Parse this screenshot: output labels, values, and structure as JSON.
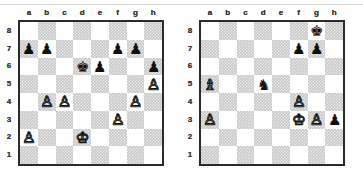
{
  "page": {
    "background_color": "#ffffff",
    "hairline_color": "#d8d8d8"
  },
  "colors": {
    "light_square": "#ffffff",
    "dark_square": "#c9c9c9",
    "border": "#2b2b2b",
    "coordinate_text": "#3a3a3a",
    "black_piece": "#101010",
    "white_piece_fill": "#ffffff",
    "white_piece_outline": "#101010"
  },
  "glyphs": {
    "white_king": "♔",
    "white_queen": "♕",
    "white_rook": "♖",
    "white_bishop": "♗",
    "white_knight": "♘",
    "white_pawn": "♙",
    "black_king": "♚",
    "black_queen": "♛",
    "black_rook": "♜",
    "black_bishop": "♝",
    "black_knight": "♞",
    "black_pawn": "♟"
  },
  "coordinates": {
    "files": [
      "a",
      "b",
      "c",
      "d",
      "e",
      "f",
      "g",
      "h"
    ],
    "ranks": [
      "8",
      "7",
      "6",
      "5",
      "4",
      "3",
      "2",
      "1"
    ]
  },
  "boards": [
    {
      "id": "left",
      "name": "chess-diagram-left",
      "orientation": "white-bottom",
      "show_files_top": true,
      "show_files_bottom": true,
      "show_ranks_left": true,
      "show_ranks_right": true,
      "pieces": [
        {
          "square": "a7",
          "color": "black",
          "type": "pawn",
          "glyph": "♟"
        },
        {
          "square": "b7",
          "color": "black",
          "type": "pawn",
          "glyph": "♟"
        },
        {
          "square": "f7",
          "color": "black",
          "type": "pawn",
          "glyph": "♟"
        },
        {
          "square": "g7",
          "color": "black",
          "type": "pawn",
          "glyph": "♟"
        },
        {
          "square": "d6",
          "color": "black",
          "type": "king",
          "glyph": "♚"
        },
        {
          "square": "e6",
          "color": "black",
          "type": "pawn",
          "glyph": "♟"
        },
        {
          "square": "h6",
          "color": "black",
          "type": "pawn",
          "glyph": "♟"
        },
        {
          "square": "h5",
          "color": "white",
          "type": "pawn",
          "glyph": "♙"
        },
        {
          "square": "b4",
          "color": "white",
          "type": "pawn",
          "glyph": "♙"
        },
        {
          "square": "c4",
          "color": "white",
          "type": "pawn",
          "glyph": "♙"
        },
        {
          "square": "g4",
          "color": "white",
          "type": "pawn",
          "glyph": "♙"
        },
        {
          "square": "f3",
          "color": "white",
          "type": "pawn",
          "glyph": "♙"
        },
        {
          "square": "a2",
          "color": "white",
          "type": "pawn",
          "glyph": "♙"
        },
        {
          "square": "d2",
          "color": "white",
          "type": "king",
          "glyph": "♔"
        }
      ]
    },
    {
      "id": "right",
      "name": "chess-diagram-right",
      "orientation": "white-bottom",
      "show_files_top": true,
      "show_files_bottom": true,
      "show_ranks_left": true,
      "show_ranks_right": true,
      "pieces": [
        {
          "square": "g8",
          "color": "black",
          "type": "king",
          "glyph": "♚"
        },
        {
          "square": "f7",
          "color": "black",
          "type": "pawn",
          "glyph": "♟"
        },
        {
          "square": "g7",
          "color": "black",
          "type": "pawn",
          "glyph": "♟"
        },
        {
          "square": "a5",
          "color": "white",
          "type": "bishop",
          "glyph": "♗"
        },
        {
          "square": "d5",
          "color": "black",
          "type": "knight",
          "glyph": "♞"
        },
        {
          "square": "f4",
          "color": "white",
          "type": "pawn",
          "glyph": "♙"
        },
        {
          "square": "a3",
          "color": "white",
          "type": "pawn",
          "glyph": "♙"
        },
        {
          "square": "f3",
          "color": "white",
          "type": "king",
          "glyph": "♔"
        },
        {
          "square": "g3",
          "color": "white",
          "type": "pawn",
          "glyph": "♙"
        },
        {
          "square": "h3",
          "color": "black",
          "type": "pawn",
          "glyph": "♟"
        }
      ]
    }
  ]
}
